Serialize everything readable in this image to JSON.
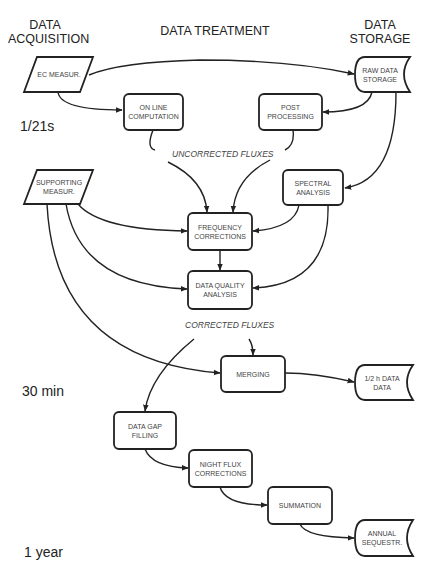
{
  "headers": {
    "acquisition": "DATA\nACQUISITION",
    "treatment": "DATA TREATMENT",
    "storage": "DATA\nSTORAGE"
  },
  "time_scales": [
    "1/21s",
    "30 min",
    "1 year"
  ],
  "flux_labels": {
    "uncorrected": "UNCORRECTED FLUXES",
    "corrected": "CORRECTED FLUXES"
  },
  "nodes": {
    "ec_measur": {
      "label": "EC MEASUR.",
      "shape": "parallelogram"
    },
    "raw_data_storage": {
      "label": "RAW DATA\nSTORAGE",
      "shape": "storage"
    },
    "online_computation": {
      "label": "ON LINE\nCOMPUTATION",
      "shape": "rounded-rect"
    },
    "post_processing": {
      "label": "POST\nPROCESSING",
      "shape": "rounded-rect"
    },
    "supporting_measur": {
      "label": "SUPPORTING\nMEASUR.",
      "shape": "parallelogram"
    },
    "spectral_analysis": {
      "label": "SPECTRAL\nANALYSIS",
      "shape": "rounded-rect"
    },
    "frequency_corrections": {
      "label": "FREQUENCY\nCORRECTIONS",
      "shape": "rounded-rect"
    },
    "data_quality_analysis": {
      "label": "DATA QUALITY\nANALYSIS",
      "shape": "rounded-rect"
    },
    "merging": {
      "label": "MERGING",
      "shape": "rounded-rect"
    },
    "half_hour_data": {
      "label": "1/2 h DATA\nDATA",
      "shape": "storage"
    },
    "data_gap_filling": {
      "label": "DATA GAP\nFILLING",
      "shape": "rounded-rect"
    },
    "night_flux_corrections": {
      "label": "NIGHT FLUX\nCORRECTIONS",
      "shape": "rounded-rect"
    },
    "summation": {
      "label": "SUMMATION",
      "shape": "rounded-rect"
    },
    "annual_sequestr": {
      "label": "ANNUAL\nSEQUESTR.",
      "shape": "storage"
    }
  },
  "edges": [
    [
      "ec_measur",
      "raw_data_storage"
    ],
    [
      "ec_measur",
      "online_computation"
    ],
    [
      "raw_data_storage",
      "post_processing"
    ],
    [
      "raw_data_storage",
      "spectral_analysis"
    ],
    [
      "online_computation",
      "frequency_corrections"
    ],
    [
      "post_processing",
      "frequency_corrections"
    ],
    [
      "supporting_measur",
      "frequency_corrections"
    ],
    [
      "supporting_measur",
      "data_quality_analysis"
    ],
    [
      "supporting_measur",
      "merging"
    ],
    [
      "spectral_analysis",
      "frequency_corrections"
    ],
    [
      "spectral_analysis",
      "data_quality_analysis"
    ],
    [
      "frequency_corrections",
      "data_quality_analysis"
    ],
    [
      "data_quality_analysis",
      "merging"
    ],
    [
      "data_quality_analysis",
      "data_gap_filling"
    ],
    [
      "merging",
      "half_hour_data"
    ],
    [
      "data_gap_filling",
      "night_flux_corrections"
    ],
    [
      "night_flux_corrections",
      "summation"
    ],
    [
      "summation",
      "annual_sequestr"
    ]
  ]
}
